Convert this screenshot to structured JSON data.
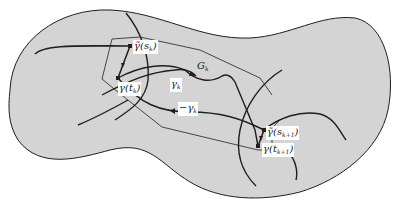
{
  "figure": {
    "colors": {
      "region_fill": "#d4d4d4",
      "stroke": "#1f1f1f",
      "label_bg": "#ffffff",
      "background": "#ffffff"
    },
    "labels": {
      "gamma_tilde_s_k": {
        "base": "γ̃(s",
        "sub": "k",
        "tail": ")"
      },
      "gamma_t_k": {
        "base": "γ(t",
        "sub": "k",
        "tail": ")"
      },
      "gamma_tilde_s_k1": {
        "base": "γ̃(s",
        "sub": "k+1",
        "tail": ")"
      },
      "gamma_t_k1": {
        "base": "γ(t",
        "sub": "k+1",
        "tail": ")"
      },
      "G_k": {
        "base": "G",
        "sub": "k"
      },
      "gamma_k": {
        "base": "γ",
        "sub": "k"
      },
      "neg_gamma_k": {
        "base": "−γ",
        "sub": "k"
      }
    }
  }
}
